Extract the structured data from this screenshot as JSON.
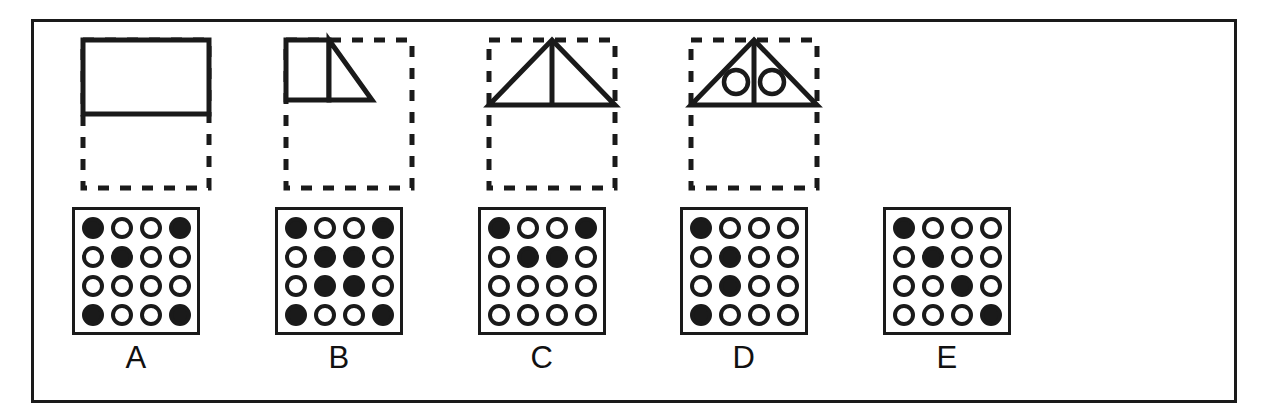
{
  "figure": {
    "frame_border_color": "#1a1a1a",
    "ink_color": "#1a1a1a",
    "background_color": "#ffffff",
    "grid_rows": 4,
    "grid_cols": 4
  },
  "options": [
    {
      "label": "A",
      "shape_name": "solid-rectangle-top-half",
      "shape_description": "Solid rectangle occupying the top half of a dashed square outline",
      "dots": [
        [
          1,
          0,
          0,
          1
        ],
        [
          0,
          1,
          0,
          0
        ],
        [
          0,
          0,
          0,
          0
        ],
        [
          1,
          0,
          0,
          1
        ]
      ]
    },
    {
      "label": "B",
      "shape_name": "square-plus-triangle-top-left",
      "shape_description": "Square on the left and right triangle on the right, filling the top-left quadrant of a dashed square",
      "dots": [
        [
          1,
          0,
          0,
          1
        ],
        [
          0,
          1,
          1,
          0
        ],
        [
          0,
          1,
          1,
          0
        ],
        [
          1,
          0,
          0,
          1
        ]
      ]
    },
    {
      "label": "C",
      "shape_name": "triangle-with-center-line",
      "shape_description": "Triangle with apex at top center and a vertical center line, in the top half of a dashed square",
      "dots": [
        [
          1,
          0,
          0,
          1
        ],
        [
          0,
          1,
          1,
          0
        ],
        [
          0,
          0,
          0,
          0
        ],
        [
          0,
          0,
          0,
          0
        ]
      ]
    },
    {
      "label": "D",
      "shape_name": "triangle-with-center-line-and-two-circles",
      "shape_description": "Triangle with vertical center line and two small circles, one in each half, in the top half of a dashed square",
      "dots": [
        [
          1,
          0,
          0,
          0
        ],
        [
          0,
          1,
          0,
          0
        ],
        [
          0,
          1,
          0,
          0
        ],
        [
          1,
          0,
          0,
          0
        ]
      ]
    },
    {
      "label": "E",
      "shape_name": "no-figure",
      "shape_description": "No figure shown above the dot grid",
      "dots": [
        [
          1,
          0,
          0,
          0
        ],
        [
          0,
          1,
          0,
          0
        ],
        [
          0,
          0,
          1,
          0
        ],
        [
          0,
          0,
          0,
          1
        ]
      ]
    }
  ]
}
